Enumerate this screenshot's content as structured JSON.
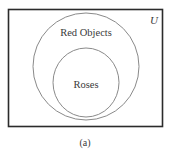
{
  "diagram": {
    "type": "venn",
    "universe": {
      "label": "U"
    },
    "sets": [
      {
        "id": "red-objects",
        "label": "Red Objects"
      },
      {
        "id": "roses",
        "label": "Roses",
        "subset_of": "red-objects"
      }
    ],
    "caption": "(a)",
    "colors": {
      "stroke_box": "#2b2b2b",
      "stroke_circle": "#8a8a8a",
      "text": "#3a3a3a"
    }
  }
}
